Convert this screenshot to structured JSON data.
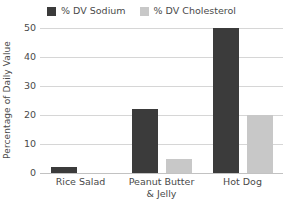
{
  "chart_data": {
    "type": "bar",
    "title": "",
    "subtitle": "",
    "xlabel": "",
    "ylabel": "Percentage of Daily Value",
    "categories": [
      "Rice Salad",
      "Peanut Butter\n& Jelly",
      "Hot Dog"
    ],
    "series": [
      {
        "name": "% DV Sodium",
        "color": "#3b3b3b",
        "values": [
          2,
          22,
          50
        ]
      },
      {
        "name": "% DV Cholesterol",
        "color": "#c8c8c8",
        "values": [
          0,
          5,
          20
        ]
      }
    ],
    "ylim": [
      0,
      50
    ],
    "yticks": [
      0,
      10,
      20,
      30,
      40,
      50
    ],
    "ytick_labels": [
      "0",
      "10",
      "20",
      "30",
      "40",
      "50"
    ],
    "grid": true,
    "grid_axis": "y",
    "legend_position": "top-center",
    "orientation": "vertical",
    "grouped": true
  },
  "legend": {
    "entries": [
      {
        "label": "% DV Sodium",
        "swatch_name": "legend-swatch-sodium"
      },
      {
        "label": "% DV Cholesterol",
        "swatch_name": "legend-swatch-cholesterol"
      }
    ]
  },
  "axes": {
    "y_title": "Percentage of Daily Value",
    "y_ticks": [
      "50",
      "40",
      "30",
      "20",
      "10",
      "0"
    ],
    "x_labels": [
      "Rice Salad",
      "Peanut Butter\n& Jelly",
      "Hot Dog"
    ]
  },
  "colors": {
    "sodium": "#3b3b3b",
    "cholesterol": "#c8c8c8",
    "gridline": "#d6d6d6",
    "baseline": "#c2c2c2",
    "text": "#4a4a4a",
    "background": "#ffffff"
  }
}
